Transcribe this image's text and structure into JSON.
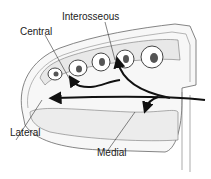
{
  "diagram": {
    "type": "anatomical cross-section",
    "labels": {
      "interosseous": "Interosseous",
      "central": "Central",
      "lateral": "Lateral",
      "medial": "Medial"
    },
    "colors": {
      "line": "#555555",
      "arrow": "#111111",
      "fill": "#f4f4f4"
    }
  }
}
